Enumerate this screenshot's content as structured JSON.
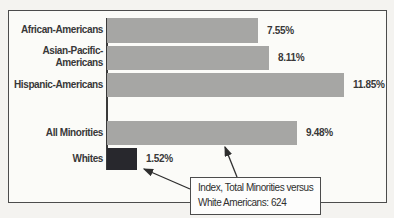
{
  "chart_data": {
    "type": "bar",
    "orientation": "horizontal",
    "categories": [
      "African-Americans",
      "Asian-Pacific-Americans",
      "Hispanic-Americans",
      "All Minorities",
      "Whites"
    ],
    "values": [
      7.55,
      8.11,
      11.85,
      9.48,
      1.52
    ],
    "value_labels": [
      "7.55%",
      "8.11%",
      "11.85%",
      "9.48%",
      "1.52%"
    ],
    "xlim": [
      0,
      12
    ],
    "grid": false,
    "legend": false,
    "title": "",
    "xlabel": "",
    "ylabel": "",
    "annotation": "Index, Total Minorities versus White Americans: 624",
    "bar_colors": [
      "#a6a6a4",
      "#a6a6a4",
      "#a6a6a4",
      "#a6a6a4",
      "#28282d"
    ]
  },
  "rows": [
    {
      "label_lines": [
        "African-Americans"
      ],
      "value": 7.55,
      "value_label": "7.55%"
    },
    {
      "label_lines": [
        "Asian-Pacific-",
        "Americans"
      ],
      "value": 8.11,
      "value_label": "8.11%"
    },
    {
      "label_lines": [
        "Hispanic-Americans"
      ],
      "value": 11.85,
      "value_label": "11.85%"
    },
    {
      "label_lines": [
        "All Minorities"
      ],
      "value": 9.48,
      "value_label": "9.48%"
    },
    {
      "label_lines": [
        "Whites"
      ],
      "value": 1.52,
      "value_label": "1.52%"
    }
  ],
  "callout": {
    "line1": "Index, Total Minorities versus",
    "line2": "White Americans: 624"
  },
  "colors": {
    "background": "#f4f3f0",
    "frame_bg": "#fbfbf8",
    "frame_border": "#4c4c4c",
    "bar_gray": "#a6a6a4",
    "bar_dark": "#28282d",
    "axis_line": "#3a3a3a",
    "text": "#383838",
    "arrow": "#2e2e2e"
  }
}
